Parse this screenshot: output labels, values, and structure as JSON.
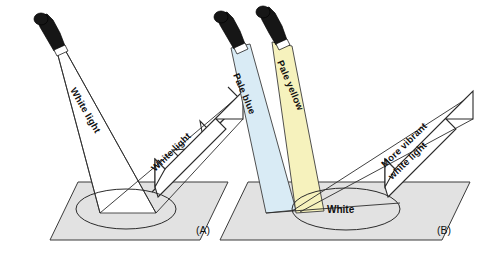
{
  "figure": {
    "background_color": "#ffffff"
  },
  "panels": [
    {
      "id": "A",
      "caption": "(A)",
      "lamp_count": 1,
      "incident_beam_label": "White light",
      "reflected_arrow_label": "White light",
      "reflected_arrow_label_line2": "",
      "spot_label": "",
      "beam_colors": [
        "#ffffff"
      ]
    },
    {
      "id": "B",
      "caption": "(B)",
      "lamp_count": 2,
      "incident_beam_label": "Pale blue",
      "incident_beam_label_2": "Pale yellow",
      "reflected_arrow_label": "More vibrant",
      "reflected_arrow_label_line2": "white light",
      "spot_label": "White",
      "beam_colors": [
        "#d9ebf5",
        "#f6f2bd"
      ]
    }
  ],
  "colors": {
    "pale_blue": "#d9ebf5",
    "pale_yellow": "#f6f2bd",
    "floor_gray": "#e2e2e2",
    "lamp_black": "#161616",
    "outline": "#2b2b2b",
    "white_beam": "#ffffff"
  }
}
